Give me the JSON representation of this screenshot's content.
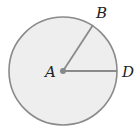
{
  "diagram": {
    "type": "circle-with-radii",
    "center_label": "A",
    "points": [
      {
        "label": "B",
        "angle_deg": 58
      },
      {
        "label": "D",
        "angle_deg": 0
      }
    ],
    "colors": {
      "fill": "#eeeeee",
      "stroke": "#8a8a8a",
      "center_dot": "#888888"
    }
  }
}
